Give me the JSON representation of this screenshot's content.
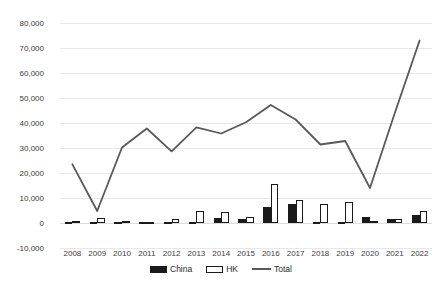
{
  "chart_data": {
    "type": "bar",
    "title": "",
    "subtitle": "",
    "xlabel": "",
    "ylabel": "",
    "categories": [
      "2008",
      "2009",
      "2010",
      "2011",
      "2012",
      "2013",
      "2014",
      "2015",
      "2016",
      "2017",
      "2018",
      "2019",
      "2020",
      "2021",
      "2022"
    ],
    "ylim": [
      -10000,
      80000
    ],
    "ytick_labels": [
      "80,000",
      "70,000",
      "60,000",
      "50,000",
      "40,000",
      "30,000",
      "20,000",
      "10,000",
      "0",
      "-10,000"
    ],
    "ytick_values": [
      80000,
      70000,
      60000,
      50000,
      40000,
      30000,
      20000,
      10000,
      0,
      -10000
    ],
    "ytick_step": 10000,
    "grid": true,
    "legend_position": "bottom",
    "series": [
      {
        "name": "China",
        "type": "bar",
        "color": "#1a1a1a",
        "fill": "solid",
        "values": [
          200,
          300,
          200,
          200,
          200,
          300,
          2200,
          1800,
          6500,
          7500,
          600,
          600,
          2400,
          1600,
          3200
        ]
      },
      {
        "name": "HK",
        "type": "bar",
        "color": "#ffffff",
        "border": "#1a1a1a",
        "fill": "hollow",
        "values": [
          1000,
          1900,
          700,
          500,
          1600,
          4800,
          4300,
          2400,
          15600,
          9200,
          7800,
          8600,
          800,
          1800,
          4700
        ]
      },
      {
        "name": "Total",
        "type": "line",
        "color": "#595959",
        "values": [
          23500,
          4800,
          30200,
          37800,
          28700,
          38300,
          35800,
          40300,
          47200,
          41400,
          31400,
          32800,
          14000,
          44000,
          73000
        ]
      }
    ]
  },
  "legend": {
    "items": [
      {
        "label": "China",
        "marker": "bar-solid-icon"
      },
      {
        "label": "HK",
        "marker": "bar-hollow-icon"
      },
      {
        "label": "Total",
        "marker": "line-icon"
      }
    ]
  },
  "colors": {
    "china": "#1a1a1a",
    "hk_fill": "#ffffff",
    "hk_border": "#1a1a1a",
    "total_line": "#595959",
    "grid": "#e8e8e8",
    "text": "#3b3b3b",
    "background": "#ffffff"
  }
}
